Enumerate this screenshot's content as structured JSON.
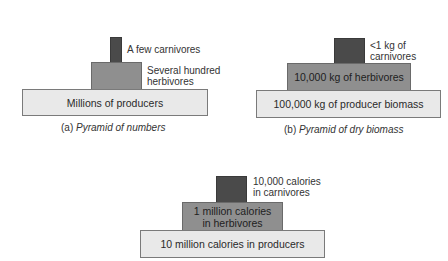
{
  "colors": {
    "producer": "#e9e9e9",
    "herbivore": "#8f8f8f",
    "carnivore": "#4a4a4a"
  },
  "pyramids": [
    {
      "id": "a",
      "caption_prefix": "(a)",
      "caption_title": "Pyramid of numbers",
      "levels": {
        "producers": "Millions of producers",
        "herbivores_line1": "Several hundred",
        "herbivores_line2": "herbivores",
        "carnivores": "A few carnivores"
      }
    },
    {
      "id": "b",
      "caption_prefix": "(b)",
      "caption_title": "Pyramid of dry biomass",
      "levels": {
        "producers": "100,000 kg of producer biomass",
        "herbivores": "10,000 kg of herbivores",
        "carnivores_line1": "<1 kg of",
        "carnivores_line2": "carnivores"
      }
    },
    {
      "id": "c",
      "levels": {
        "producers": "10 million calories in producers",
        "herbivores_line1": "1 million calories",
        "herbivores_line2": "in herbivores",
        "carnivores_line1": "10,000 calories",
        "carnivores_line2": "in carnivores"
      }
    }
  ]
}
